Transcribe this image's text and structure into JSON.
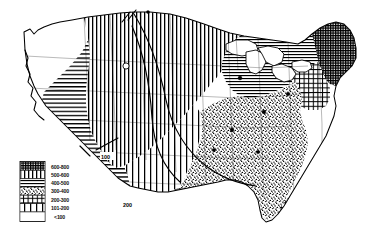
{
  "map": {
    "title": "United States thematic isoline map",
    "description": "Black and white scanned map of the contiguous United States showing seven hatch-pattern value classes with isolines",
    "background_color": "#ffffff",
    "ink_color": "#000000"
  },
  "legend": {
    "name": "map-legend",
    "entries": [
      {
        "label": "600-800",
        "pattern": "dense-grid",
        "swatch": "swatch-600-800"
      },
      {
        "label": "500-600",
        "pattern": "vertical-lines",
        "swatch": "swatch-500-600"
      },
      {
        "label": "400-500",
        "pattern": "horizontal-lines",
        "swatch": "swatch-400-500"
      },
      {
        "label": "300-400",
        "pattern": "stipple",
        "swatch": "swatch-300-400"
      },
      {
        "label": "200-300",
        "pattern": "cross-hatch",
        "swatch": "swatch-200-300"
      },
      {
        "label": "101-200",
        "pattern": "wide-vertical",
        "swatch": "swatch-101-200"
      },
      {
        "label": "<100",
        "pattern": "blank",
        "swatch": "swatch-under-100"
      }
    ]
  },
  "isolines": [
    {
      "label": "100",
      "position": "central-plains"
    },
    {
      "label": "200",
      "position": "southern-plains"
    }
  ],
  "regions": [
    {
      "name": "pacific-northwest",
      "pattern": "blank"
    },
    {
      "name": "northern-rockies",
      "pattern": "vertical-lines"
    },
    {
      "name": "great-basin",
      "pattern": "horizontal-lines"
    },
    {
      "name": "great-plains",
      "pattern": "vertical-lines"
    },
    {
      "name": "upper-midwest",
      "pattern": "horizontal-lines"
    },
    {
      "name": "midwest-southeast",
      "pattern": "stipple"
    },
    {
      "name": "northeast",
      "pattern": "dense-grid"
    },
    {
      "name": "florida",
      "pattern": "cross-hatch"
    },
    {
      "name": "texas-gulf",
      "pattern": "cross-hatch"
    }
  ]
}
